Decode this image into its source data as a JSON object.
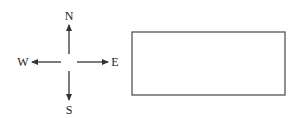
{
  "compass": {
    "north": "N",
    "south": "S",
    "east": "E",
    "west": "W"
  },
  "colors": {
    "stroke": "#333333",
    "box_border": "#555555"
  }
}
